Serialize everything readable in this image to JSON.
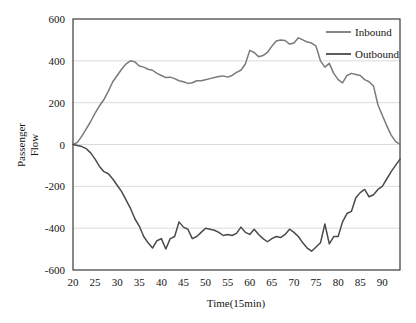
{
  "chart_data": {
    "type": "line",
    "title": "",
    "xlabel": "Time(15min)",
    "ylabel": "Passenger Flow",
    "ylabel_line1": "Passenger",
    "ylabel_line2": "Flow",
    "xlim": [
      20,
      94
    ],
    "ylim": [
      -600,
      600
    ],
    "xticks": [
      20,
      25,
      30,
      35,
      40,
      45,
      50,
      55,
      60,
      65,
      70,
      75,
      80,
      85,
      90
    ],
    "xtick_labels": [
      "20",
      "25",
      "30",
      "35",
      "40",
      "45",
      "50",
      "55",
      "60",
      "65",
      "70",
      "75",
      "80",
      "85",
      "90"
    ],
    "yticks": [
      -600,
      -400,
      -200,
      0,
      200,
      400,
      600
    ],
    "ytick_labels": [
      "-600",
      "-400",
      "-200",
      "0",
      "200",
      "400",
      "600"
    ],
    "grid": "horizontal",
    "legend_position": "top-right",
    "series": [
      {
        "name": "Inbound",
        "color": "#7a7a7a",
        "x": [
          20,
          21,
          22,
          23,
          24,
          25,
          26,
          27,
          28,
          29,
          30,
          31,
          32,
          33,
          34,
          35,
          36,
          37,
          38,
          39,
          40,
          41,
          42,
          43,
          44,
          45,
          46,
          47,
          48,
          49,
          50,
          51,
          52,
          53,
          54,
          55,
          56,
          57,
          58,
          59,
          60,
          61,
          62,
          63,
          64,
          65,
          66,
          67,
          68,
          69,
          70,
          71,
          72,
          73,
          74,
          75,
          76,
          77,
          78,
          79,
          80,
          81,
          82,
          83,
          84,
          85,
          86,
          87,
          88,
          89,
          90,
          91,
          92,
          93,
          94
        ],
        "values": [
          0,
          10,
          40,
          75,
          110,
          150,
          185,
          215,
          255,
          300,
          330,
          360,
          385,
          400,
          395,
          375,
          370,
          360,
          355,
          340,
          330,
          320,
          322,
          315,
          305,
          300,
          292,
          295,
          305,
          305,
          310,
          315,
          320,
          325,
          328,
          322,
          330,
          345,
          355,
          385,
          450,
          440,
          420,
          425,
          440,
          470,
          495,
          500,
          497,
          480,
          485,
          510,
          500,
          490,
          485,
          470,
          400,
          370,
          388,
          340,
          310,
          295,
          330,
          340,
          335,
          330,
          310,
          300,
          280,
          190,
          140,
          90,
          45,
          15,
          0
        ]
      },
      {
        "name": "Outbound",
        "color": "#4a4a4a",
        "x": [
          20,
          21,
          22,
          23,
          24,
          25,
          26,
          27,
          28,
          29,
          30,
          31,
          32,
          33,
          34,
          35,
          36,
          37,
          38,
          39,
          40,
          41,
          42,
          43,
          44,
          45,
          46,
          47,
          48,
          49,
          50,
          51,
          52,
          53,
          54,
          55,
          56,
          57,
          58,
          59,
          60,
          61,
          62,
          63,
          64,
          65,
          66,
          67,
          68,
          69,
          70,
          71,
          72,
          73,
          74,
          75,
          76,
          77,
          78,
          79,
          80,
          81,
          82,
          83,
          84,
          85,
          86,
          87,
          88,
          89,
          90,
          91,
          92,
          93,
          94
        ],
        "values": [
          0,
          -5,
          -10,
          -20,
          -40,
          -70,
          -105,
          -130,
          -140,
          -165,
          -195,
          -225,
          -265,
          -305,
          -355,
          -390,
          -440,
          -470,
          -495,
          -460,
          -450,
          -500,
          -450,
          -440,
          -370,
          -395,
          -405,
          -450,
          -440,
          -420,
          -400,
          -405,
          -410,
          -420,
          -435,
          -430,
          -435,
          -425,
          -395,
          -420,
          -430,
          -405,
          -430,
          -450,
          -465,
          -450,
          -440,
          -445,
          -430,
          -405,
          -420,
          -440,
          -470,
          -495,
          -510,
          -490,
          -470,
          -380,
          -475,
          -440,
          -440,
          -370,
          -330,
          -320,
          -255,
          -230,
          -215,
          -250,
          -240,
          -215,
          -200,
          -165,
          -130,
          -100,
          -70
        ]
      }
    ]
  },
  "legend": {
    "items": [
      {
        "label": "Inbound",
        "color": "#7a7a7a"
      },
      {
        "label": "Outbound",
        "color": "#4a4a4a"
      }
    ]
  },
  "axes": {
    "x_title": "Time(15min)",
    "y_title_line1": "Passenger",
    "y_title_line2": "Flow"
  }
}
